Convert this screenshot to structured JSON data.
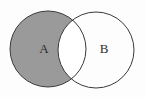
{
  "figure": {
    "kind": "venn-diagram",
    "width": 146,
    "height": 97,
    "background_color": "#fdfdfd",
    "outline_color": "#3a3a3a",
    "outline_width": 1,
    "shaded_region_label": "A only",
    "shading_color": "#9a9a9a",
    "unshaded_color": "#ffffff",
    "label_color": "#2b2b2b"
  },
  "sets": [
    {
      "id": "set-a",
      "label": "A",
      "label_x": 44,
      "label_y": 50,
      "cx": 48,
      "cy": 49,
      "r": 38,
      "filled": true,
      "fill_color": "#9a9a9a"
    },
    {
      "id": "set-b",
      "label": "B",
      "label_x": 104,
      "label_y": 50,
      "cx": 96,
      "cy": 50,
      "r": 38,
      "filled": false,
      "fill_color": "#ffffff"
    }
  ],
  "regions": [
    {
      "id": "region-a-only",
      "name": "A minus B",
      "shaded": true,
      "color": "#9a9a9a"
    },
    {
      "id": "region-intersection",
      "name": "A intersect B",
      "shaded": false,
      "color": "#ffffff"
    },
    {
      "id": "region-b-only",
      "name": "B minus A",
      "shaded": false,
      "color": "#ffffff"
    }
  ]
}
